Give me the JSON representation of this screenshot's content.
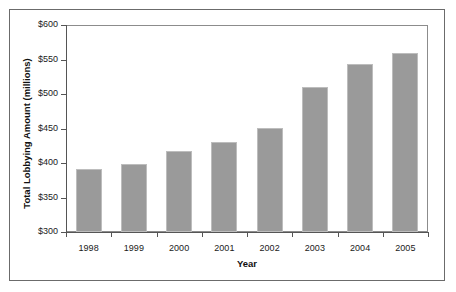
{
  "chart_data": {
    "type": "bar",
    "title": "",
    "xlabel": "Year",
    "ylabel": "Total Lobbying Amount (millions)",
    "categories": [
      "1998",
      "1999",
      "2000",
      "2001",
      "2002",
      "2003",
      "2004",
      "2005"
    ],
    "values": [
      391,
      399,
      418,
      430,
      451,
      510,
      544,
      560
    ],
    "value_labels": [
      "$391",
      "$399",
      "$418",
      "$430",
      "$451",
      "$510",
      "$544",
      "$560"
    ],
    "ylim": [
      300,
      600
    ],
    "ytick_labels": [
      "$600",
      "$550",
      "$500",
      "$450",
      "$400",
      "$350",
      "$300"
    ],
    "ytick_values": [
      600,
      550,
      500,
      450,
      400,
      350,
      300
    ],
    "grid": false,
    "legend": "none",
    "bar_color": "#9a9a9a",
    "bar_edge_color": "#bdbdbd",
    "axis_color": "#555555",
    "frame_color": "#6b6b6b",
    "background": "#ffffff"
  }
}
